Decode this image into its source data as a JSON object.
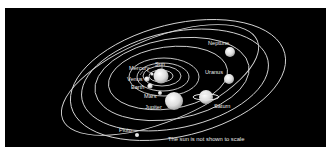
{
  "diagram": {
    "caption": "The sun is not shown to scale",
    "colors": {
      "background": "#000000",
      "frame": "#ffffff",
      "orbit": "#d8d8d8",
      "label": "#e8e8e8",
      "planet": "#e6e6e6"
    },
    "labels": {
      "sun": "Sun",
      "mercury": "Mercury",
      "venus": "Venus",
      "earth": "Earth",
      "mars": "Mars",
      "jupiter": "Jupiter",
      "saturn": "Saturn",
      "uranus": "Uranus",
      "neptune": "Neptune",
      "pluto": "Pluto"
    }
  }
}
